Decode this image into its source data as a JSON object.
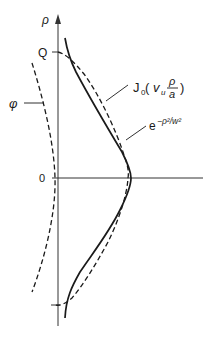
{
  "diagram": {
    "type": "mode-profile-comparison",
    "axes": {
      "vertical_label": "ρ",
      "origin_label": "0",
      "top_marker_label": "Q"
    },
    "curves": [
      {
        "id": "bessel",
        "style": "dashed",
        "label_main": "J",
        "label_sub": "0",
        "label_arg_open": " (",
        "label_nu": "v",
        "label_nu_sub": "u",
        "label_num": "ρ",
        "label_den": "a",
        "label_arg_close": ")"
      },
      {
        "id": "gaussian",
        "style": "solid",
        "label_base": "e",
        "label_exp": "−ρ²/w²"
      },
      {
        "id": "phase",
        "style": "dashed",
        "label": "φ"
      }
    ],
    "colors": {
      "line": "#1a1a1a",
      "axis": "#333333",
      "background": "#ffffff"
    }
  }
}
